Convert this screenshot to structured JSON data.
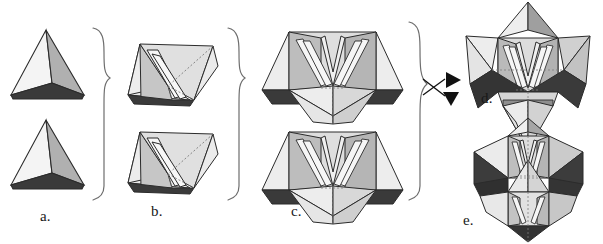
{
  "figure": {
    "caption_labels": {
      "a": "a.",
      "b": "b.",
      "c": "c.",
      "d": "d.",
      "e": "e."
    },
    "palette": {
      "background": "#ffffff",
      "outline": "#2b2b2b",
      "face_light": "#f2f2f2",
      "face_pale": "#e2e2e2",
      "face_mid": "#c9c9c9",
      "face_medium": "#a8a8a8",
      "face_dark": "#3b3b3b",
      "face_darkest": "#2a2a2a",
      "brace": "#6e6e6e",
      "arrow": "#111111",
      "hidden_edge": "#8a8a8a"
    },
    "connectors": {
      "brace_1": "right-curly-brace",
      "brace_2": "right-curly-brace",
      "brace_3": "right-curly-brace",
      "branch_arrow_up": "arrowhead-up-right",
      "branch_arrow_down": "arrowhead-down-right"
    },
    "steps": [
      {
        "id": "a",
        "label": "a.",
        "description": "single tetrahedron",
        "count": 2,
        "faces": [
          "light-left-face",
          "medium-right-face",
          "dark-bottom-face"
        ]
      },
      {
        "id": "b",
        "label": "b.",
        "description": "tetrahedron pair with internal struts",
        "count": 2,
        "faces": [
          "pale-outer-face",
          "mid-inner-face",
          "dark-bottom-face"
        ]
      },
      {
        "id": "c",
        "label": "c.",
        "description": "four-point star module",
        "count": 2,
        "faces": [
          "pale-upper-wing",
          "mid-inner-wall",
          "dark-lower-wing",
          "light-central-spike"
        ]
      },
      {
        "id": "d",
        "label": "d.",
        "description": "stellated octahedron, point-up orientation",
        "count": 1
      },
      {
        "id": "e",
        "label": "e.",
        "description": "stellated octahedron, alternate orientation",
        "count": 1
      }
    ]
  }
}
